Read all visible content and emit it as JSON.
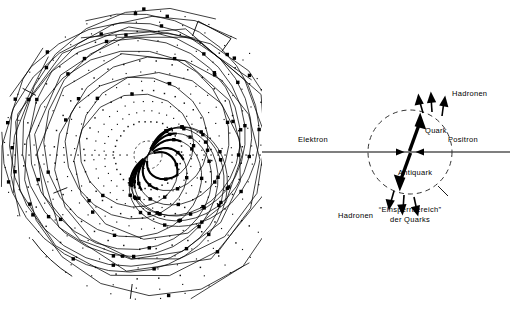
{
  "figure": {
    "panels": [
      {
        "id": "event-display",
        "kind": "detector-event-display",
        "description": "Zwei-Jet-Ereignis im Spurendetektor"
      },
      {
        "id": "schematic",
        "kind": "quark-antiquark-schematic",
        "description": "Elektron-Positron-Annihilation in Quark und Antiquark"
      }
    ]
  },
  "schematic": {
    "beam_left_label": "Elektron",
    "beam_right_label": "Positron",
    "quark_label": "Quark",
    "antiquark_label": "Antiquark",
    "hadrons_top_label": "Hadronen",
    "hadrons_bottom_label": "Hadronen",
    "confinement_label_line1": "“Einsperrbereich”",
    "confinement_label_line2": "der  Quarks",
    "colors": {
      "ink": "#000000",
      "beam_line": "#555555",
      "dashed_circle": "#333333"
    },
    "circle": {
      "cx": 148,
      "cy": 152,
      "r": 42
    }
  },
  "event_display": {
    "center": {
      "x": 148,
      "y": 155
    },
    "vertex_circle_r": 14,
    "wire_rings": [
      34,
      44,
      54,
      64,
      74,
      84,
      94,
      104,
      114,
      124,
      134,
      144
    ],
    "n_radial_spokes": 36,
    "jets": [
      {
        "name": "jet-upper-right",
        "axis_deg": -63,
        "tracks": [
          {
            "angle_deg": -67.5,
            "curvature": 0.00055,
            "length": 152,
            "hits": 9
          },
          {
            "angle_deg": -64.5,
            "curvature": 0.00045,
            "length": 150,
            "hits": 9
          },
          {
            "angle_deg": -62.0,
            "curvature": 0.0004,
            "length": 148,
            "hits": 9
          },
          {
            "angle_deg": -59.0,
            "curvature": 0.0006,
            "length": 146,
            "hits": 8
          },
          {
            "angle_deg": -50.0,
            "curvature": 0.00075,
            "length": 150,
            "hits": 9
          },
          {
            "angle_deg": -33.0,
            "curvature": 0.0011,
            "length": 140,
            "hits": 8
          },
          {
            "angle_deg": -20.0,
            "curvature": 0.0015,
            "length": 128,
            "hits": 7
          }
        ]
      },
      {
        "name": "jet-lower-left",
        "axis_deg": 131,
        "tracks": [
          {
            "angle_deg": 118.0,
            "curvature": -0.0012,
            "length": 140,
            "hits": 8
          },
          {
            "angle_deg": 126.0,
            "curvature": -0.0007,
            "length": 148,
            "hits": 9
          },
          {
            "angle_deg": 130.0,
            "curvature": -0.0005,
            "length": 150,
            "hits": 9
          },
          {
            "angle_deg": 133.0,
            "curvature": -0.00045,
            "length": 150,
            "hits": 9
          },
          {
            "angle_deg": 136.0,
            "curvature": -0.0004,
            "length": 148,
            "hits": 9
          },
          {
            "angle_deg": 141.0,
            "curvature": -0.0006,
            "length": 142,
            "hits": 8
          },
          {
            "angle_deg": 100.0,
            "curvature": -0.0018,
            "length": 135,
            "hits": 7
          }
        ]
      }
    ],
    "calorimeter_markers": [
      {
        "name": "bracket-upper-right",
        "angle_deg": -62,
        "radius": 143,
        "span_deg": 15,
        "style": "bracket"
      },
      {
        "name": "bracket-right",
        "angle_deg": -30,
        "radius": 143,
        "span_deg": 8,
        "style": "tick"
      },
      {
        "name": "arc-lower-left",
        "angle_deg": 133,
        "radius": 143,
        "span_deg": 22,
        "style": "arc"
      },
      {
        "name": "arc-bottom",
        "angle_deg": 97,
        "radius": 143,
        "span_deg": 10,
        "style": "tick"
      },
      {
        "name": "tick-upper-left",
        "angle_deg": -152,
        "radius": 140,
        "span_deg": 7,
        "style": "tick"
      },
      {
        "name": "tick-left",
        "angle_deg": 158,
        "radius": 100,
        "span_deg": 7,
        "style": "tick"
      }
    ]
  }
}
